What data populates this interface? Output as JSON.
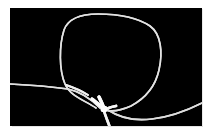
{
  "figure": {
    "type": "grayscale-photograph",
    "alt_text": "A thin light-colored string forms a large rounded loop against a black field; a nearly horizontal strand enters from the left, crosses the loop's lower-left side, and meets a thick bright junction at the bottom center where a short strand drops off the bottom edge and another strand sweeps out to the right edge.",
    "colors": {
      "background_page": "#ffffff",
      "field": "#000000",
      "string": "#e8e8e8",
      "string_highlight": "#ffffff",
      "edge_shadow": "#cfcfcf"
    },
    "frame": {
      "x": 10,
      "y": 8,
      "width": 192,
      "height": 118
    },
    "features": [
      {
        "name": "loop",
        "label": "main loop",
        "description": "large rounded closed loop occupying the upper portion of the frame",
        "bbox": [
          60,
          14,
          162,
          110
        ]
      },
      {
        "name": "left-tail",
        "label": "left entering strand",
        "description": "near-horizontal strand entering at the left edge and running right toward the junction",
        "bbox": [
          10,
          82,
          100,
          96
        ]
      },
      {
        "name": "right-tail",
        "label": "right exiting strand",
        "description": "strand leaving the junction, dipping down and rising to the right edge",
        "bbox": [
          104,
          100,
          202,
          120
        ]
      },
      {
        "name": "bottom-tail",
        "label": "descending strand",
        "description": "short thick strand dropping from the junction past the bottom edge",
        "bbox": [
          106,
          108,
          118,
          137
        ]
      },
      {
        "name": "junction",
        "label": "bright junction",
        "description": "thick bright node where three strands converge",
        "center": [
          104,
          109
        ]
      },
      {
        "name": "crossing",
        "label": "strand crossing",
        "description": "narrow lens where the left strand crosses the loop's lower-left side",
        "center": [
          76,
          88
        ]
      }
    ]
  }
}
